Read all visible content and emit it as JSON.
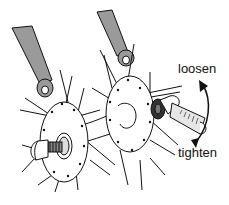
{
  "figure": {
    "labels": {
      "loosen": "loosen",
      "tighten": "tighten"
    },
    "colors": {
      "line": "#111111",
      "fork_fill": "#9a9a9a",
      "wrench_fill": "#e6e6e6",
      "background": "#ffffff"
    }
  }
}
